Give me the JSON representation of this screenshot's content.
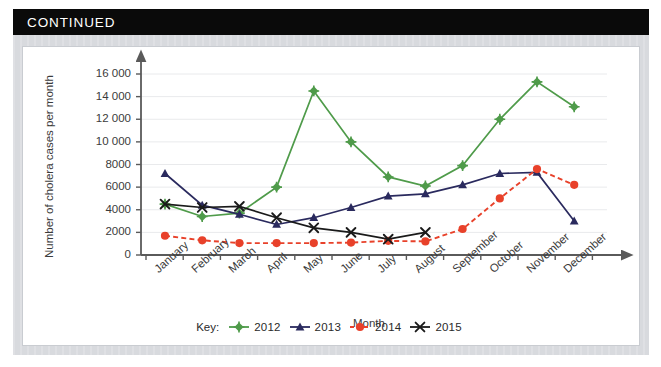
{
  "banner": {
    "label": "CONTINUED"
  },
  "chart_data": {
    "type": "line",
    "title": "",
    "xlabel": "Month",
    "ylabel": "Number of cholera cases per month",
    "categories": [
      "January",
      "February",
      "March",
      "April",
      "May",
      "June",
      "July",
      "August",
      "September",
      "October",
      "November",
      "December"
    ],
    "ylim": [
      0,
      16000
    ],
    "ytick_values": [
      0,
      2000,
      4000,
      6000,
      8000,
      10000,
      12000,
      14000,
      16000
    ],
    "ytick_labels": [
      "0",
      "2000",
      "4000",
      "6000",
      "8000",
      "10 000",
      "12 000",
      "14 000",
      "16 000"
    ],
    "grid": "horizontal",
    "legend_position": "bottom",
    "legend_prefix": "Key:",
    "series": [
      {
        "name": "2012",
        "color": "#4f9b4a",
        "marker": "diamond",
        "line_style": "solid",
        "values": [
          4500,
          3400,
          3700,
          6000,
          14500,
          10000,
          6900,
          6100,
          7900,
          12000,
          15300,
          13100
        ]
      },
      {
        "name": "2013",
        "color": "#2a2a5e",
        "marker": "triangle",
        "line_style": "solid",
        "values": [
          7200,
          4400,
          3600,
          2700,
          3300,
          4200,
          5200,
          5400,
          6200,
          7200,
          7300,
          3000
        ]
      },
      {
        "name": "2014",
        "color": "#e8412a",
        "marker": "circle",
        "line_style": "dashed",
        "values": [
          1700,
          1300,
          1050,
          1050,
          1050,
          1100,
          1250,
          1200,
          2300,
          5000,
          7600,
          6200
        ]
      },
      {
        "name": "2015",
        "color": "#1a1a1a",
        "marker": "cross",
        "line_style": "solid",
        "values": [
          4500,
          4200,
          4300,
          3300,
          2400,
          2000,
          1400,
          2000,
          null,
          null,
          null,
          null
        ]
      }
    ]
  }
}
